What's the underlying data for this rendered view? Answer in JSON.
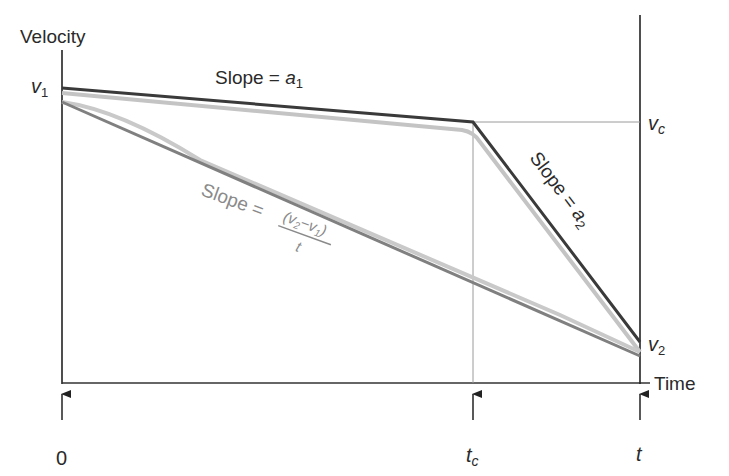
{
  "diagram": {
    "y_axis_label": "Velocity",
    "x_axis_label": "Time",
    "v1_label": "v",
    "v1_sub": "1",
    "vc_label": "v",
    "vc_sub": "c",
    "v2_label": "v",
    "v2_sub": "2",
    "tick_0": "0",
    "tick_tc": "t",
    "tick_tc_sub": "c",
    "tick_t": "t",
    "slope_a1_text": "Slope = ",
    "slope_a1_var": "a",
    "slope_a1_sub": "1",
    "slope_a2_text": "Slope = ",
    "slope_a2_var": "a",
    "slope_a2_sub": "2",
    "slope_avg_text": "Slope = ",
    "slope_avg_numerator": "(v",
    "slope_avg_num_sub1": "2",
    "slope_avg_num_mid": "−v",
    "slope_avg_num_sub2": "1",
    "slope_avg_num_end": ")",
    "slope_avg_denominator": "t",
    "colors": {
      "axis": "#222222",
      "piecewise_line": "#3a3a3a",
      "actual_curve": "#c4c4c4",
      "average_line": "#808080",
      "guide_line": "#9a9a9a",
      "avg_label": "#8a8a8a"
    }
  }
}
